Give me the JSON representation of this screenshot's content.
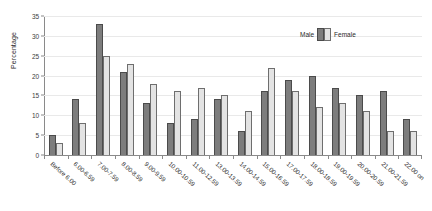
{
  "chart_data": {
    "type": "bar",
    "title": "",
    "xlabel": "",
    "ylabel": "Percentage",
    "ylim": [
      0,
      35
    ],
    "yticks": [
      0,
      5,
      10,
      15,
      20,
      25,
      30,
      35
    ],
    "grid": true,
    "legend_position": "top-right",
    "categories": [
      "Before 6.00",
      "6.00-6.59",
      "7.00-7.59",
      "8.00-8.59",
      "9.00-9.59",
      "10.00-10.59",
      "11.00-12.59",
      "13.00-13.59",
      "14.00-14.59",
      "15.00-16.59",
      "17.00-17.59",
      "18.00-18.59",
      "19.00-19.59",
      "20.00-20.59",
      "21.00-21.59",
      "22.00 on"
    ],
    "series": [
      {
        "name": "Male",
        "color": "#7d7d7d",
        "values": [
          5,
          14,
          33,
          21,
          13,
          8,
          9,
          14,
          6,
          16,
          19,
          20,
          17,
          15,
          16,
          9
        ]
      },
      {
        "name": "Female",
        "color": "#e3e3e3",
        "values": [
          3,
          8,
          25,
          23,
          18,
          16,
          17,
          15,
          11,
          22,
          16,
          12,
          13,
          11,
          6,
          6
        ]
      }
    ]
  },
  "legend": {
    "male_label": "Male",
    "female_label": "Female"
  }
}
